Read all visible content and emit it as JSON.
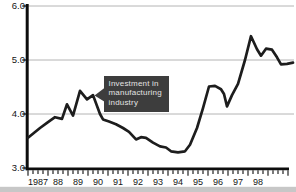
{
  "chart_data": {
    "type": "line",
    "title": "",
    "xlabel": "",
    "ylabel": "",
    "x_axis": {
      "tick_labels": [
        "1987",
        "88",
        "89",
        "90",
        "91",
        "92",
        "93",
        "94",
        "95",
        "96",
        "97",
        "98"
      ],
      "minor_ticks_per_year": 4,
      "start_year": 1987
    },
    "y_axis": {
      "tick_labels": [
        "6.0",
        "5.0",
        "4.0",
        "3.0"
      ],
      "tick_values": [
        6.0,
        5.0,
        4.0,
        3.0
      ],
      "range": [
        3.0,
        6.0
      ],
      "gridlines_at": [
        4.0,
        5.0,
        6.0
      ]
    },
    "annotation": {
      "text_lines": [
        "Investment in",
        "manufacturing",
        "industry"
      ],
      "target_year": 1990.25,
      "target_value": 4.35
    },
    "series": [
      {
        "name": "Investment in manufacturing industry",
        "points": [
          [
            1987.0,
            3.56
          ],
          [
            1987.6,
            3.74
          ],
          [
            1988.0,
            3.85
          ],
          [
            1988.35,
            3.94
          ],
          [
            1988.7,
            3.91
          ],
          [
            1988.95,
            4.18
          ],
          [
            1989.25,
            3.97
          ],
          [
            1989.6,
            4.43
          ],
          [
            1989.95,
            4.27
          ],
          [
            1990.25,
            4.35
          ],
          [
            1990.6,
            4.0
          ],
          [
            1990.75,
            3.9
          ],
          [
            1991.05,
            3.86
          ],
          [
            1991.4,
            3.81
          ],
          [
            1991.75,
            3.74
          ],
          [
            1992.05,
            3.67
          ],
          [
            1992.4,
            3.53
          ],
          [
            1992.65,
            3.57
          ],
          [
            1992.9,
            3.56
          ],
          [
            1993.25,
            3.47
          ],
          [
            1993.6,
            3.4
          ],
          [
            1993.9,
            3.38
          ],
          [
            1994.15,
            3.31
          ],
          [
            1994.5,
            3.29
          ],
          [
            1994.85,
            3.31
          ],
          [
            1995.1,
            3.43
          ],
          [
            1995.45,
            3.74
          ],
          [
            1995.75,
            4.11
          ],
          [
            1996.05,
            4.51
          ],
          [
            1996.35,
            4.52
          ],
          [
            1996.65,
            4.46
          ],
          [
            1996.8,
            4.37
          ],
          [
            1996.95,
            4.14
          ],
          [
            1997.2,
            4.35
          ],
          [
            1997.5,
            4.56
          ],
          [
            1997.85,
            5.0
          ],
          [
            1998.15,
            5.44
          ],
          [
            1998.45,
            5.2
          ],
          [
            1998.65,
            5.08
          ],
          [
            1998.9,
            5.21
          ],
          [
            1999.2,
            5.19
          ],
          [
            1999.45,
            5.05
          ],
          [
            1999.65,
            4.92
          ],
          [
            1999.95,
            4.93
          ],
          [
            2000.25,
            4.95
          ]
        ]
      }
    ],
    "legend": {
      "visible": false
    },
    "grid": "horizontal-only",
    "colors": {
      "line": "#1d1d1d",
      "grid": "#ababab",
      "axis": "#0d0d0d",
      "tick_label": "#141414",
      "annotation_bg": "#3d3d3d",
      "annotation_text": "#e3e3e3",
      "background": "#ffffff",
      "bottom_strip": "#c7c7c7"
    }
  }
}
